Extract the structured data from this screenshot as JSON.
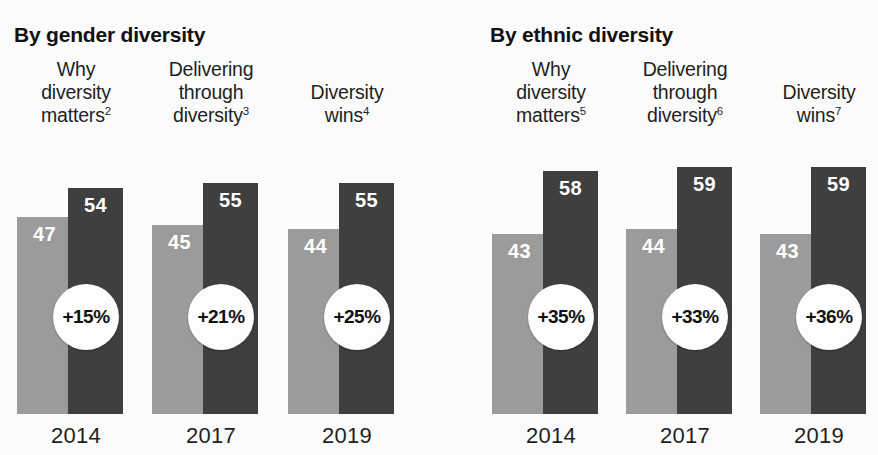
{
  "chart_data": {
    "type": "bar",
    "title": "",
    "xlabel": "",
    "ylabel": "",
    "ylim": [
      0,
      62
    ],
    "grid": false,
    "legend_position": "none",
    "panels": [
      {
        "heading": "By gender diversity",
        "groups": [
          {
            "label_lines": [
              "Why",
              "diversity",
              "matters"
            ],
            "label_superscript": "2",
            "year": "2014",
            "bars": [
              {
                "series": "bottom quartile",
                "value": 47,
                "shade": "light"
              },
              {
                "series": "top quartile",
                "value": 54,
                "shade": "dark"
              }
            ],
            "badge": "+15%"
          },
          {
            "label_lines": [
              "Delivering",
              "through",
              "diversity"
            ],
            "label_superscript": "3",
            "year": "2017",
            "bars": [
              {
                "series": "bottom quartile",
                "value": 45,
                "shade": "light"
              },
              {
                "series": "top quartile",
                "value": 55,
                "shade": "dark"
              }
            ],
            "badge": "+21%"
          },
          {
            "label_lines": [
              "Diversity",
              "wins"
            ],
            "label_superscript": "4",
            "year": "2019",
            "bars": [
              {
                "series": "bottom quartile",
                "value": 44,
                "shade": "light"
              },
              {
                "series": "top quartile",
                "value": 55,
                "shade": "dark"
              }
            ],
            "badge": "+25%"
          }
        ]
      },
      {
        "heading": "By ethnic diversity",
        "groups": [
          {
            "label_lines": [
              "Why",
              "diversity",
              "matters"
            ],
            "label_superscript": "5",
            "year": "2014",
            "bars": [
              {
                "series": "bottom quartile",
                "value": 43,
                "shade": "light"
              },
              {
                "series": "top quartile",
                "value": 58,
                "shade": "dark"
              }
            ],
            "badge": "+35%"
          },
          {
            "label_lines": [
              "Delivering",
              "through",
              "diversity"
            ],
            "label_superscript": "6",
            "year": "2017",
            "bars": [
              {
                "series": "bottom quartile",
                "value": 44,
                "shade": "light"
              },
              {
                "series": "top quartile",
                "value": 59,
                "shade": "dark"
              }
            ],
            "badge": "+33%"
          },
          {
            "label_lines": [
              "Diversity",
              "wins"
            ],
            "label_superscript": "7",
            "year": "2019",
            "bars": [
              {
                "series": "bottom quartile",
                "value": 43,
                "shade": "light"
              },
              {
                "series": "top quartile",
                "value": 59,
                "shade": "dark"
              }
            ],
            "badge": "+36%"
          }
        ]
      }
    ],
    "colors": {
      "light_bar": "#9b9b9b",
      "dark_bar": "#3f3f3f",
      "badge_fill": "#fdfdfd",
      "background": "#fbfbfb",
      "text": "#1f1f1f",
      "bar_value_text": "#ffffff"
    }
  },
  "layout": {
    "panel_geometry": [
      {
        "left": 0,
        "width": 440
      },
      {
        "left": 440,
        "width": 438
      }
    ],
    "group_geometry": [
      [
        {
          "left": 17,
          "width": 118
        },
        {
          "left": 152,
          "width": 118
        },
        {
          "left": 288,
          "width": 118
        }
      ],
      [
        {
          "left": 52,
          "width": 118
        },
        {
          "left": 186,
          "width": 118
        },
        {
          "left": 320,
          "width": 118
        }
      ]
    ],
    "bar_width": 55,
    "dark_bar_offset": 51,
    "bars_area_height": 260,
    "badge_diameter": 66
  }
}
